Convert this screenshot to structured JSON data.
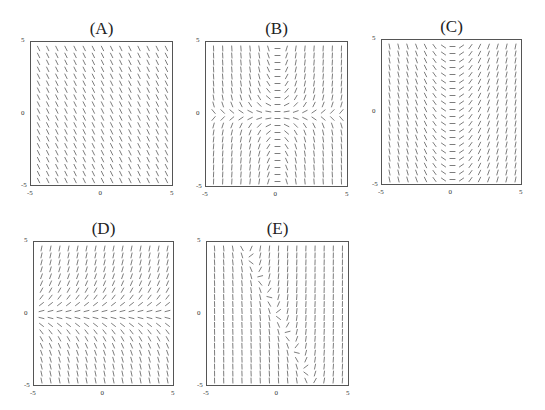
{
  "chart_data": [
    {
      "type": "slope_field",
      "label": "(A)",
      "title": "(A)",
      "xlim": [
        -5,
        5
      ],
      "ylim": [
        -5,
        5
      ],
      "xticks": [
        "-5",
        "0",
        "5"
      ],
      "yticks": [
        "5",
        "0",
        "-5"
      ],
      "slope_rule": "constant negative slope",
      "expr": "-2",
      "grid": [
        15,
        20
      ],
      "box": {
        "left": 30,
        "top": 41,
        "width": 143,
        "height": 145
      }
    },
    {
      "type": "slope_field",
      "label": "(B)",
      "title": "(B)",
      "xlim": [
        -5,
        5
      ],
      "ylim": [
        -5,
        5
      ],
      "xticks": [
        "-5",
        "0",
        "5"
      ],
      "yticks": [
        "5",
        "0",
        "-5"
      ],
      "slope_rule": "zero slope along x=0 and y=0; positive in quadrants I and III",
      "expr": "x*y",
      "grid": [
        15,
        20
      ],
      "box": {
        "left": 205,
        "top": 41,
        "width": 143,
        "height": 146
      }
    },
    {
      "type": "slope_field",
      "label": "(C)",
      "title": "(C)",
      "xlim": [
        -5,
        5
      ],
      "ylim": [
        -5,
        5
      ],
      "xticks": [
        "-5",
        "0",
        "5"
      ],
      "yticks": [
        "5",
        "0",
        "-5"
      ],
      "slope_rule": "slope depends only on x; zero at x=0",
      "expr": "x",
      "grid": [
        15,
        20
      ],
      "box": {
        "left": 381,
        "top": 39,
        "width": 141,
        "height": 146
      }
    },
    {
      "type": "slope_field",
      "label": "(D)",
      "title": "(D)",
      "xlim": [
        -5,
        5
      ],
      "ylim": [
        -5,
        5
      ],
      "xticks": [
        "-5",
        "0",
        "5"
      ],
      "yticks": [
        "5",
        "0",
        "-5"
      ],
      "slope_rule": "slope depends only on y; zero at y=0",
      "expr": "y",
      "grid": [
        15,
        20
      ],
      "box": {
        "left": 33,
        "top": 241,
        "width": 141,
        "height": 145
      }
    },
    {
      "type": "slope_field",
      "label": "(E)",
      "title": "(E)",
      "xlim": [
        -5,
        5
      ],
      "ylim": [
        -5,
        5
      ],
      "xticks": [
        "-5",
        "0",
        "5"
      ],
      "yticks": [
        "5",
        "0",
        "-5"
      ],
      "slope_rule": "zero slope along y = -2x",
      "expr": "3*(2*x+y)",
      "grid": [
        15,
        20
      ],
      "box": {
        "left": 206,
        "top": 241,
        "width": 143,
        "height": 145
      }
    }
  ],
  "colors": {
    "segment": "#6e6e6e",
    "frame": "#555555",
    "text": "#222222"
  }
}
